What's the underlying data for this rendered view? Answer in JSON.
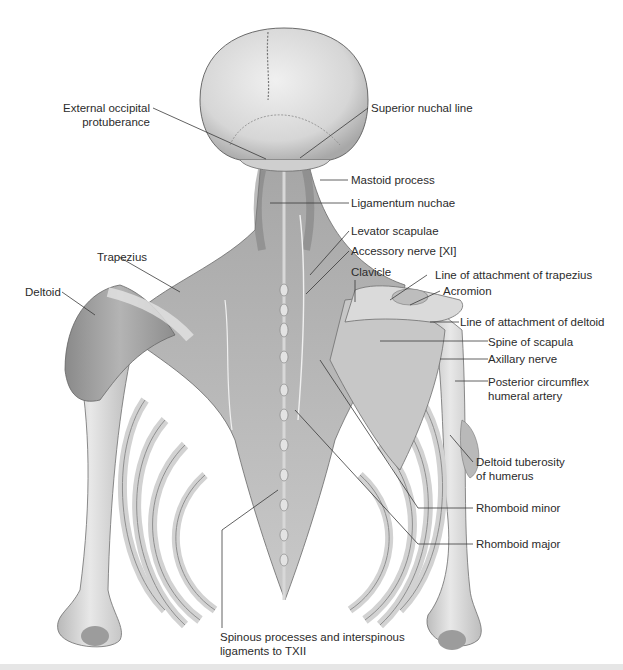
{
  "figure": {
    "colors": {
      "bone": "#dcdcdc",
      "bone_shade": "#a9a9a9",
      "muscle": "#9a9a9a",
      "muscle_dark": "#6e6e6e",
      "leader_line": "#3a3a3a",
      "text": "#2b2b2b",
      "background": "#ffffff"
    }
  },
  "labels": {
    "external_occipital_protuberance": {
      "line1": "External occipital",
      "line2": "protuberance"
    },
    "superior_nuchal_line": "Superior nuchal line",
    "mastoid_process": "Mastoid process",
    "ligamentum_nuchae": "Ligamentum nuchae",
    "levator_scapulae": "Levator scapulae",
    "accessory_nerve": "Accessory nerve [XI]",
    "trapezius": "Trapezius",
    "clavicle": "Clavicle",
    "line_attachment_trapezius": "Line of attachment of trapezius",
    "deltoid": "Deltoid",
    "acromion": "Acromion",
    "line_attachment_deltoid": "Line of attachment of deltoid",
    "spine_of_scapula": "Spine of scapula",
    "axillary_nerve": "Axillary nerve",
    "posterior_circumflex": {
      "line1": "Posterior circumflex",
      "line2": "humeral artery"
    },
    "deltoid_tuberosity": {
      "line1": "Deltoid tuberosity",
      "line2": "of humerus"
    },
    "rhomboid_minor": "Rhomboid minor",
    "rhomboid_major": "Rhomboid major",
    "spinous_processes": {
      "line1": "Spinous processes and interspinous",
      "line2": "ligaments to TXII"
    }
  }
}
